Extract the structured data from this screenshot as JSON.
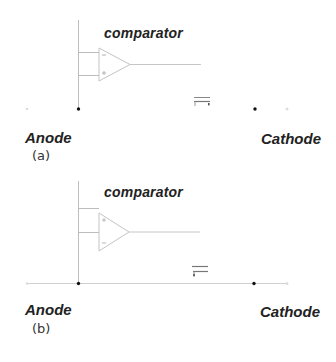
{
  "figure": {
    "panels": [
      {
        "id": "a",
        "caption": "(a)",
        "comparator_label": "comparator",
        "anode_label": "Anode",
        "cathode_label": "Cathode",
        "anode_cathode_line_visible": false,
        "comparator_inputs": [
          "-",
          "+"
        ]
      },
      {
        "id": "b",
        "caption": "(b)",
        "comparator_label": "comparator",
        "anode_label": "Anode",
        "cathode_label": "Cathode",
        "anode_cathode_line_visible": true,
        "comparator_inputs": [
          "+",
          "-"
        ]
      }
    ]
  },
  "colors": {
    "wire": "#b8b8b8",
    "faint_wire": "#d6d6d6",
    "node_dot": "#111111",
    "text": "#222222"
  }
}
